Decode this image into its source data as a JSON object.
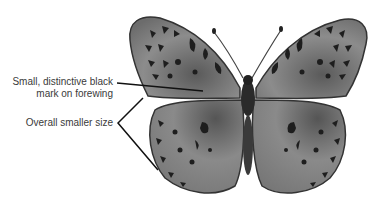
{
  "figure": {
    "annotations": [
      {
        "id": "forewing-mark",
        "line1": "Small, distinctive black",
        "line2": "mark on forewing"
      },
      {
        "id": "size",
        "line1": "Overall smaller size"
      }
    ]
  },
  "colors": {
    "text": "#3a3a3a",
    "leader_line": "#111111",
    "wing_base": "#8a8a8a",
    "wing_dark": "#2a2a2a",
    "background": "#ffffff"
  }
}
